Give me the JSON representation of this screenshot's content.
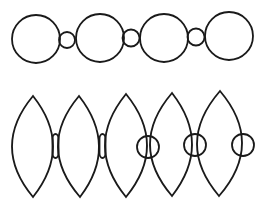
{
  "diagram": {
    "stroke_color": "#1a1a1a",
    "background": "#ffffff",
    "stroke_width": 1.8,
    "top_row": {
      "description": "chain of large circles linked by small circles",
      "large_circles": [
        {
          "cx": 36,
          "cy": 39,
          "r": 24
        },
        {
          "cx": 100,
          "cy": 38,
          "r": 24
        },
        {
          "cx": 164,
          "cy": 38,
          "r": 24
        },
        {
          "cx": 229,
          "cy": 36,
          "r": 24
        }
      ],
      "small_circles": [
        {
          "cx": 67,
          "cy": 40,
          "r": 8
        },
        {
          "cx": 131,
          "cy": 38,
          "r": 8.5
        },
        {
          "cx": 196,
          "cy": 37,
          "r": 8.5
        }
      ]
    },
    "bottom_row": {
      "description": "chain of lens (vesica) shapes with connecting capsules and overlapping circles",
      "lenses": [
        {
          "top": [
            33,
            96
          ],
          "bottom": [
            33,
            197
          ],
          "left": 12,
          "right": 53
        },
        {
          "top": [
            79,
            96
          ],
          "bottom": [
            80,
            197
          ],
          "left": 58,
          "right": 99
        },
        {
          "top": [
            126,
            94
          ],
          "bottom": [
            126,
            197
          ],
          "left": 105,
          "right": 147
        },
        {
          "top": [
            172,
            93
          ],
          "bottom": [
            172,
            196
          ],
          "left": 150,
          "right": 192
        },
        {
          "top": [
            220,
            91
          ],
          "bottom": [
            219,
            196
          ],
          "left": 197,
          "right": 242
        }
      ],
      "capsules": [
        {
          "x": 52.5,
          "y": 134,
          "w": 6,
          "h": 24
        },
        {
          "x": 99.5,
          "y": 134,
          "w": 6,
          "h": 24
        }
      ],
      "circles": [
        {
          "cx": 148,
          "cy": 147,
          "r": 11
        },
        {
          "cx": 195,
          "cy": 145,
          "r": 11
        },
        {
          "cx": 243,
          "cy": 145,
          "r": 11
        }
      ]
    }
  }
}
